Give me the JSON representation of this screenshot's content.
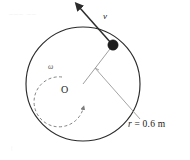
{
  "figure": {
    "type": "physics-diagram",
    "background_color": "#ffffff",
    "stroke_color": "#2b2b2b",
    "leader_color": "#8a8a8a",
    "dash_color": "#7d7d7d",
    "particle_color": "#1d1d1d",
    "circle": {
      "center_x": 83,
      "center_y": 84,
      "radius_px": 57,
      "radius_label": "r = 0.6 m",
      "radius_symbol": "r",
      "radius_value": "= 0.6 m"
    },
    "center_point": {
      "label": "O",
      "x": 83,
      "y": 84
    },
    "particle": {
      "x": 113,
      "y": 45,
      "radius_px": 5.2
    },
    "velocity_vector": {
      "label": "v",
      "tail_x": 113,
      "tail_y": 45,
      "tip_x": 78,
      "tip_y": 6
    },
    "angular_velocity": {
      "label": "ω",
      "arc_radius_px": 25,
      "direction": "counterclockwise",
      "style": "dashed"
    },
    "ghost": {
      "top_left_artifact": "––– ––",
      "bottom_left_artifact": "|"
    }
  }
}
